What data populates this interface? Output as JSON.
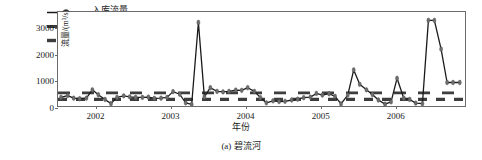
{
  "figure": {
    "caption": "(a) 碧流河",
    "xlabel": "年份",
    "ylabel": "流量/(m³/s)"
  },
  "legend": {
    "items": [
      {
        "label": "入库流量",
        "style": "line-marker",
        "color": "#1a1a1a"
      },
      {
        "label": "枯水期分界线",
        "style": "dashed-long",
        "color": "#3d3d3d"
      },
      {
        "label": "最小生态径流",
        "style": "dashed-short",
        "color": "#3d3d3d"
      }
    ]
  },
  "chart_data": {
    "type": "line",
    "title": "",
    "xlabel": "年份",
    "ylabel": "流量/(m³/s)",
    "xlim": [
      2001.5,
      2006.95
    ],
    "ylim": [
      0,
      3600
    ],
    "yticks": [
      0,
      1000,
      2000,
      3000
    ],
    "xticks": [
      2002,
      2003,
      2004,
      2005,
      2006
    ],
    "grid": false,
    "legend_position": "top-left",
    "series": [
      {
        "name": "入库流量",
        "color": "#1a1a1a",
        "marker_color": "#6e6e6e",
        "x": [
          2001.54,
          2001.63,
          2001.71,
          2001.79,
          2001.88,
          2001.96,
          2002.04,
          2002.13,
          2002.21,
          2002.29,
          2002.38,
          2002.46,
          2002.54,
          2002.63,
          2002.71,
          2002.79,
          2002.88,
          2002.96,
          2003.04,
          2003.13,
          2003.21,
          2003.29,
          2003.38,
          2003.46,
          2003.54,
          2003.63,
          2003.71,
          2003.79,
          2003.88,
          2003.96,
          2004.04,
          2004.13,
          2004.21,
          2004.29,
          2004.38,
          2004.46,
          2004.54,
          2004.63,
          2004.71,
          2004.79,
          2004.88,
          2004.96,
          2005.04,
          2005.13,
          2005.21,
          2005.29,
          2005.38,
          2005.46,
          2005.54,
          2005.63,
          2005.71,
          2005.79,
          2005.88,
          2005.96,
          2006.04,
          2006.13,
          2006.21,
          2006.29,
          2006.38,
          2006.46,
          2006.54,
          2006.63,
          2006.71,
          2006.79,
          2006.88
        ],
        "values": [
          330,
          400,
          300,
          280,
          300,
          620,
          430,
          250,
          90,
          330,
          390,
          350,
          330,
          330,
          340,
          290,
          300,
          330,
          550,
          450,
          120,
          60,
          3200,
          350,
          700,
          560,
          540,
          560,
          610,
          600,
          700,
          560,
          320,
          120,
          200,
          170,
          180,
          230,
          260,
          320,
          340,
          480,
          420,
          470,
          370,
          80,
          420,
          1380,
          830,
          620,
          440,
          230,
          70,
          160,
          1060,
          300,
          250,
          110,
          90,
          3280,
          3280,
          2180,
          900,
          900,
          900
        ],
        "peaks": [
          {
            "x": 2003.38,
            "value": 3200,
            "label": "2003 flood peak"
          },
          {
            "x": 2005.46,
            "value": 1380,
            "label": "2005 peak"
          },
          {
            "x": 2006.04,
            "value": 1060,
            "label": "2005 late peak"
          },
          {
            "x": 2006.46,
            "value": 3280,
            "label": "2006 flood peak"
          }
        ]
      }
    ],
    "reference_lines": [
      {
        "name": "枯水期分界线",
        "value": 500,
        "style": "dashed-long",
        "color": "#3d3d3d"
      },
      {
        "name": "最小生态径流",
        "value": 250,
        "style": "dashed-short",
        "color": "#3d3d3d"
      }
    ]
  }
}
